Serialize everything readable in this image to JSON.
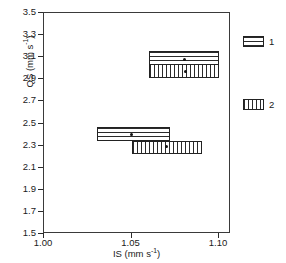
{
  "chart_data": {
    "type": "scatter",
    "title": "",
    "xlabel": "IS (mm s-1)",
    "ylabel": "QS (mm s-1)",
    "xlim": [
      1.0,
      1.105
    ],
    "ylim": [
      1.5,
      3.5
    ],
    "xticks": [
      "1.00",
      "1.05",
      "1.10"
    ],
    "xtick_values": [
      1.0,
      1.05,
      1.1
    ],
    "yticks": [
      "1.5",
      "1.7",
      "1.9",
      "2.1",
      "2.3",
      "2.5",
      "2.7",
      "2.9",
      "3.1",
      "3.3",
      "3.5"
    ],
    "ytick_values": [
      1.5,
      1.7,
      1.9,
      2.1,
      2.3,
      2.5,
      2.7,
      2.9,
      3.1,
      3.3,
      3.5
    ],
    "grid": false,
    "legend_position": "right",
    "legend": [
      {
        "label": "1",
        "pattern": "horizontal-lines"
      },
      {
        "label": "2",
        "pattern": "vertical-lines"
      }
    ],
    "series": [
      {
        "name": "1",
        "pattern": "horizontal-lines",
        "boxes": [
          {
            "x_min": 1.06,
            "x_max": 1.1,
            "y_min": 2.975,
            "y_max": 3.16,
            "center_x": 1.08,
            "center_y": 3.075
          },
          {
            "x_min": 1.03,
            "x_max": 1.072,
            "y_min": 2.34,
            "y_max": 2.465,
            "center_x": 1.05,
            "center_y": 2.4
          }
        ]
      },
      {
        "name": "2",
        "pattern": "vertical-lines",
        "boxes": [
          {
            "x_min": 1.06,
            "x_max": 1.1,
            "y_min": 2.91,
            "y_max": 3.04,
            "center_x": 1.081,
            "center_y": 2.97
          },
          {
            "x_min": 1.05,
            "x_max": 1.09,
            "y_min": 2.225,
            "y_max": 2.345,
            "center_x": 1.07,
            "center_y": 2.29
          }
        ]
      }
    ]
  },
  "axes": {
    "ylabel_text": "QS (mm s",
    "ylabel_exp": "-1",
    "ylabel_tail": ")",
    "xlabel_text": "IS (mm s",
    "xlabel_exp": "-1",
    "xlabel_tail": ")"
  }
}
